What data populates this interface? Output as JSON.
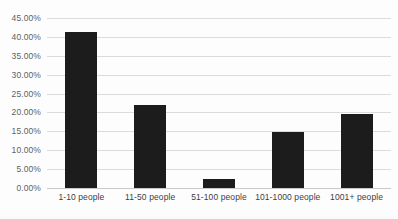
{
  "chart_data": {
    "type": "bar",
    "title": "",
    "xlabel": "",
    "ylabel": "",
    "categories": [
      "1-10 people",
      "11-50 people",
      "51-100 people",
      "101-1000 people",
      "1001+ people"
    ],
    "values": [
      41.4,
      21.9,
      2.4,
      14.7,
      19.5
    ],
    "value_labels": [
      "41.40%",
      "21.90%",
      "2.40%",
      "14.70%",
      "19.50%"
    ],
    "ylim": [
      0,
      45
    ],
    "ytick_step": 5,
    "ytick_labels": [
      "0.00%",
      "5.00%",
      "10.00%",
      "15.00%",
      "20.00%",
      "25.00%",
      "30.00%",
      "35.00%",
      "40.00%",
      "45.00%"
    ],
    "ytick_values": [
      0,
      5,
      10,
      15,
      20,
      25,
      30,
      35,
      40,
      45
    ],
    "grid": true,
    "grid_axis": "y",
    "legend": false,
    "legend_position": "none",
    "bar_color": "#1c1c1c",
    "grid_color": "#dcdcdc",
    "axis_text_color": "#5f5f5f",
    "background_color": "#fdfdfd"
  },
  "figure": {
    "title_fragment": "",
    "title_visible": false
  }
}
